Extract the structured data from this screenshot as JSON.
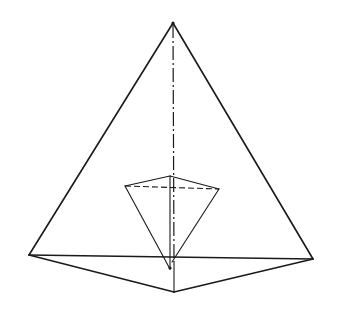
{
  "diagram": {
    "stroke_color": "#1a1a1a",
    "background": "#ffffff",
    "outer_tetrahedron": {
      "apex": [
        173,
        23
      ],
      "base_left": [
        29,
        255
      ],
      "base_right": [
        313,
        259
      ],
      "base_front": [
        174,
        292
      ]
    },
    "axis_line": {
      "from": [
        173,
        23
      ],
      "to": [
        174,
        292
      ],
      "style": "dash-dot"
    },
    "inner_pyramid": {
      "top_left": [
        125,
        186
      ],
      "top_back": [
        170,
        176
      ],
      "top_right": [
        219,
        189
      ],
      "bottom_apex": [
        170,
        269
      ]
    }
  }
}
